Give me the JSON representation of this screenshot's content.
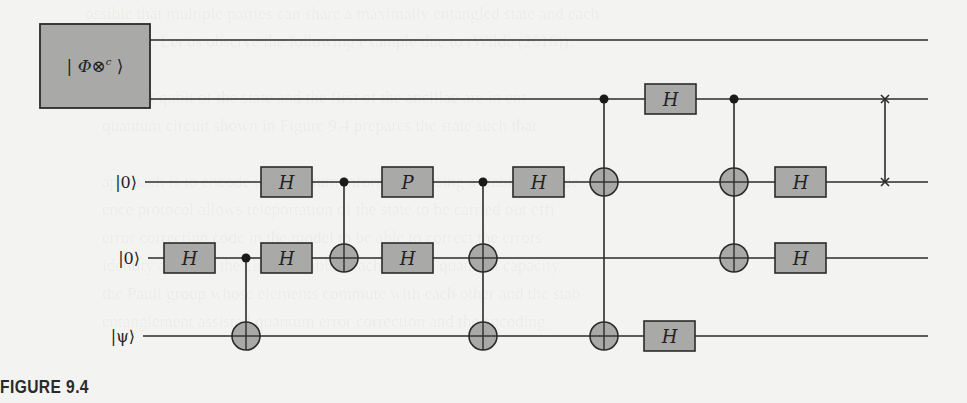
{
  "figure": {
    "caption": "FIGURE 9.4",
    "background_color": "#f3f3f1",
    "gate_fill": "#a9a9a7",
    "line_color": "#2b2b2b"
  },
  "state_block": {
    "label_prefix": "| ",
    "label_symbol": "Φ⊗",
    "label_superscript": "c",
    "label_suffix": " ⟩",
    "x": 40,
    "y": 24,
    "w": 110,
    "h": 84
  },
  "wires": [
    {
      "id": "w1",
      "label": "",
      "y": 40,
      "x_start": 150,
      "x_end": 928
    },
    {
      "id": "w2",
      "label": "",
      "y": 99,
      "x_start": 150,
      "x_end": 928
    },
    {
      "id": "w3",
      "label": "|0⟩",
      "y": 182,
      "x_start": 145,
      "x_end": 928
    },
    {
      "id": "w4",
      "label": "|0⟩",
      "y": 258,
      "x_start": 148,
      "x_end": 928
    },
    {
      "id": "w5",
      "label": "|ψ⟩",
      "y": 336,
      "x_start": 143,
      "x_end": 928
    }
  ],
  "gates": [
    {
      "type": "box",
      "label": "H",
      "wire": "w4",
      "x": 164
    },
    {
      "type": "box",
      "label": "H",
      "wire": "w3",
      "x": 261
    },
    {
      "type": "box",
      "label": "H",
      "wire": "w4",
      "x": 261
    },
    {
      "type": "box",
      "label": "P",
      "wire": "w3",
      "x": 382
    },
    {
      "type": "box",
      "label": "H",
      "wire": "w4",
      "x": 382
    },
    {
      "type": "box",
      "label": "H",
      "wire": "w3",
      "x": 513
    },
    {
      "type": "box",
      "label": "H",
      "wire": "w2",
      "x": 645
    },
    {
      "type": "box",
      "label": "H",
      "wire": "w5",
      "x": 644
    },
    {
      "type": "box",
      "label": "H",
      "wire": "w3",
      "x": 775
    },
    {
      "type": "box",
      "label": "H",
      "wire": "w4",
      "x": 775
    }
  ],
  "controlled": [
    {
      "x": 246,
      "control": "w4",
      "targets": [
        "w5"
      ]
    },
    {
      "x": 344,
      "control": "w3",
      "targets": [
        "w4"
      ]
    },
    {
      "x": 483,
      "control": "w3",
      "targets": [
        "w4",
        "w5"
      ]
    },
    {
      "x": 604,
      "control": "w2",
      "targets": [
        "w3",
        "w5"
      ]
    },
    {
      "x": 734,
      "control": "w2",
      "targets": [
        "w3",
        "w4"
      ]
    }
  ],
  "swaps": [
    {
      "x": 885,
      "wires": [
        "w2",
        "w3"
      ]
    }
  ],
  "background_text": [
    "                    ossible that multiple parties can share a maximally entangled state and each",
    "                    ts (2008)). Let us observe the following example due to (Wilde (2016)).",
    "",
    "                        the first qubit of the state and the first of the ancillae are in ent",
    "                        quantum circuit shown in Figure 9.4 prepares the state such that",
    "",
    "                        approach is to encode the quantum information using a stabilizer code",
    "                        ence protocol allows teleportation of the state to be carried out effi",
    "                        error correcting code in the model to be able to correct the errors",
    "                        identity and thus the circuit is able to achieve the quantum capacity",
    "                        the Pauli group whose elements commute with each other and the stab",
    "                        entanglement assisted quantum error correction and the encoding"
  ]
}
